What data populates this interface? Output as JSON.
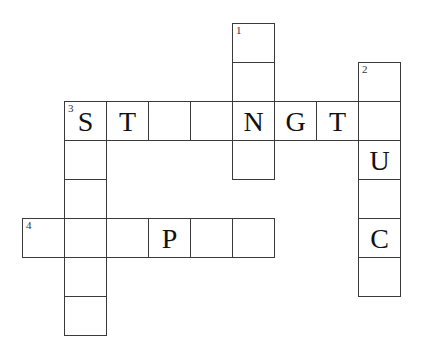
{
  "puzzle": {
    "type": "crossword",
    "cell_size": {
      "w": 42,
      "h": 39
    },
    "origin": {
      "x": 22,
      "y": 23
    },
    "cells": [
      {
        "col": 5,
        "row": 0,
        "num": "1",
        "letter": ""
      },
      {
        "col": 5,
        "row": 1,
        "num": "",
        "letter": ""
      },
      {
        "col": 8,
        "row": 1,
        "num": "2",
        "letter": ""
      },
      {
        "col": 1,
        "row": 2,
        "num": "3",
        "letter": "S"
      },
      {
        "col": 2,
        "row": 2,
        "num": "",
        "letter": "T"
      },
      {
        "col": 3,
        "row": 2,
        "num": "",
        "letter": ""
      },
      {
        "col": 4,
        "row": 2,
        "num": "",
        "letter": ""
      },
      {
        "col": 5,
        "row": 2,
        "num": "",
        "letter": "N"
      },
      {
        "col": 6,
        "row": 2,
        "num": "",
        "letter": "G"
      },
      {
        "col": 7,
        "row": 2,
        "num": "",
        "letter": "T"
      },
      {
        "col": 8,
        "row": 2,
        "num": "",
        "letter": ""
      },
      {
        "col": 1,
        "row": 3,
        "num": "",
        "letter": ""
      },
      {
        "col": 5,
        "row": 3,
        "num": "",
        "letter": ""
      },
      {
        "col": 8,
        "row": 3,
        "num": "",
        "letter": "U"
      },
      {
        "col": 1,
        "row": 4,
        "num": "",
        "letter": ""
      },
      {
        "col": 8,
        "row": 4,
        "num": "",
        "letter": ""
      },
      {
        "col": 0,
        "row": 5,
        "num": "4",
        "letter": ""
      },
      {
        "col": 1,
        "row": 5,
        "num": "",
        "letter": ""
      },
      {
        "col": 2,
        "row": 5,
        "num": "",
        "letter": ""
      },
      {
        "col": 3,
        "row": 5,
        "num": "",
        "letter": "P"
      },
      {
        "col": 4,
        "row": 5,
        "num": "",
        "letter": ""
      },
      {
        "col": 5,
        "row": 5,
        "num": "",
        "letter": ""
      },
      {
        "col": 8,
        "row": 5,
        "num": "",
        "letter": "C"
      },
      {
        "col": 1,
        "row": 6,
        "num": "",
        "letter": ""
      },
      {
        "col": 8,
        "row": 6,
        "num": "",
        "letter": ""
      },
      {
        "col": 1,
        "row": 7,
        "num": "",
        "letter": ""
      }
    ],
    "entries": {
      "across": [
        {
          "number": "3",
          "length": 8,
          "pattern": "ST__NGT_"
        },
        {
          "number": "4",
          "length": 6,
          "pattern": "___P__"
        }
      ],
      "down": [
        {
          "number": "1",
          "length": 4,
          "pattern": "__N_"
        },
        {
          "number": "2",
          "length": 6,
          "pattern": "__U_C_"
        },
        {
          "number": "3",
          "length": 6,
          "pattern": "S_____"
        }
      ]
    }
  }
}
